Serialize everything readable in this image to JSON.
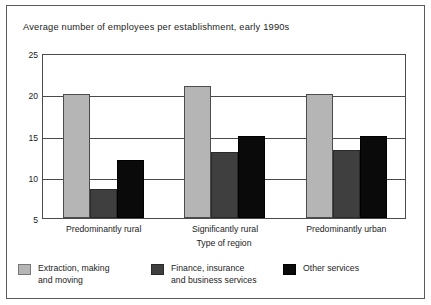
{
  "chart_data": {
    "type": "bar",
    "title": "Average number of employees per establishment, early 1990s",
    "xlabel": "Type of region",
    "ylabel": "",
    "categories": [
      "Predominantly rural",
      "Significantly rural",
      "Predominantly urban"
    ],
    "series": [
      {
        "name": "Extraction, making\nand moving",
        "values": [
          20,
          21,
          20
        ],
        "color": "#b5b5b5"
      },
      {
        "name": "Finance, insurance\nand business services",
        "values": [
          8.5,
          13,
          13.2
        ],
        "color": "#3f3f3f"
      },
      {
        "name": "Other services",
        "values": [
          12,
          15,
          15
        ],
        "color": "#0a0a0a"
      }
    ],
    "ylim": [
      5,
      25
    ],
    "yticks": [
      5,
      10,
      15,
      20,
      25
    ],
    "ytick_labels": [
      "5",
      "10",
      "15",
      "20",
      "25"
    ],
    "grid": true,
    "legend_position": "bottom"
  }
}
